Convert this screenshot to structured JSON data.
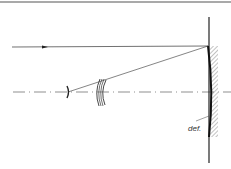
{
  "diagram": {
    "type": "optical-schematic",
    "elements": [
      {
        "id": "incident-ray",
        "kind": "ray",
        "direction": "right"
      },
      {
        "id": "reflected-ray",
        "kind": "ray"
      },
      {
        "id": "optical-axis",
        "kind": "dash-dot-line"
      },
      {
        "id": "small-convex-mirror",
        "kind": "mirror"
      },
      {
        "id": "meniscus-corrector",
        "kind": "lens-pair"
      },
      {
        "id": "primary-mirror",
        "kind": "concave-mirror",
        "hatched": true
      },
      {
        "id": "mirror-label",
        "kind": "annotation"
      }
    ],
    "labels": {
      "mirror_label": "def."
    },
    "colors": {
      "line": "#222222",
      "hatch": "#666666",
      "border": "#555555"
    }
  }
}
